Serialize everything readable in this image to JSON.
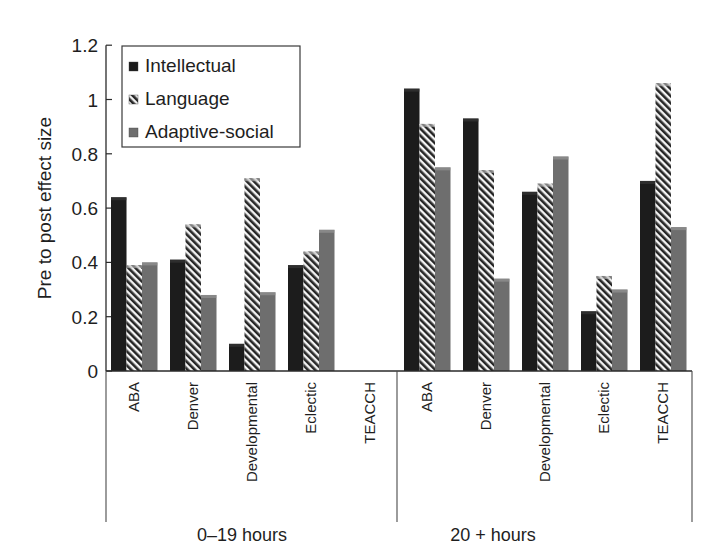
{
  "chart_data": {
    "type": "bar",
    "title": "",
    "xlabel": "",
    "ylabel": "Pre to post effect size",
    "ylim": [
      0,
      1.2
    ],
    "yticks": [
      "0",
      "0.2",
      "0.4",
      "0.6",
      "0.8",
      "1",
      "1.2"
    ],
    "grid": false,
    "legend_position": "upper-left (inside plot)",
    "groups": [
      {
        "label": "0–19 hours",
        "categories": [
          "ABA",
          "Denver",
          "Developmental",
          "Eclectic",
          "TEACCH"
        ],
        "series": [
          {
            "name": "Intellectual",
            "values": [
              0.64,
              0.41,
              0.1,
              0.39,
              null
            ]
          },
          {
            "name": "Language",
            "values": [
              0.39,
              0.54,
              0.71,
              0.44,
              null
            ]
          },
          {
            "name": "Adaptive-social",
            "values": [
              0.4,
              0.28,
              0.29,
              0.52,
              null
            ]
          }
        ]
      },
      {
        "label": "20 + hours",
        "categories": [
          "ABA",
          "Denver",
          "Developmental",
          "Eclectic",
          "TEACCH"
        ],
        "series": [
          {
            "name": "Intellectual",
            "values": [
              1.04,
              0.93,
              0.66,
              0.22,
              0.7
            ]
          },
          {
            "name": "Language",
            "values": [
              0.91,
              0.74,
              0.69,
              0.35,
              1.06
            ]
          },
          {
            "name": "Adaptive-social",
            "values": [
              0.75,
              0.34,
              0.79,
              0.3,
              0.53
            ]
          }
        ]
      }
    ],
    "legend": [
      {
        "name": "Intellectual",
        "color": "#1a1a1a",
        "pattern": "solid"
      },
      {
        "name": "Language",
        "color": "#1a1a1a",
        "pattern": "diagonal-stripes"
      },
      {
        "name": "Adaptive-social",
        "color": "#6e6e6e",
        "pattern": "solid"
      }
    ]
  }
}
